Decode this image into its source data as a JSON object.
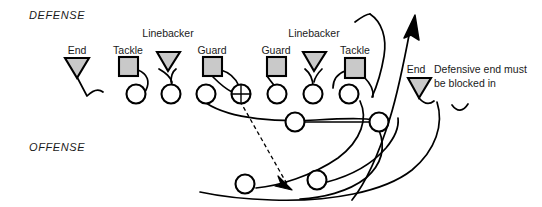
{
  "diagram": {
    "title_defense": "DEFENSE",
    "title_offense": "OFFENSE",
    "note_line1": "Defensive end must",
    "note_line2": "be blocked in",
    "colors": {
      "ink": "#000000",
      "defender_fill": "#c9c9c9",
      "offense_fill": "#ffffff",
      "background": "#ffffff"
    },
    "defenders": [
      {
        "id": "d-end-left",
        "label": "End",
        "shape": "triangle",
        "x": 77,
        "y": 66
      },
      {
        "id": "d-tackle-left",
        "label": "Tackle",
        "shape": "square",
        "x": 128,
        "y": 66
      },
      {
        "id": "d-linebacker-left",
        "label": "Linebacker",
        "shape": "triangle",
        "x": 168,
        "y": 61
      },
      {
        "id": "d-guard-left",
        "label": "Guard",
        "shape": "square",
        "x": 212,
        "y": 66
      },
      {
        "id": "d-guard-right",
        "label": "Guard",
        "shape": "square",
        "x": 276,
        "y": 66
      },
      {
        "id": "d-linebacker-right",
        "label": "Linebacker",
        "shape": "triangle",
        "x": 314,
        "y": 61
      },
      {
        "id": "d-tackle-right",
        "label": "Tackle",
        "shape": "square",
        "x": 355,
        "y": 67
      },
      {
        "id": "d-end-right",
        "label": "End",
        "shape": "triangle",
        "x": 419,
        "y": 87
      }
    ],
    "offense_line": [
      {
        "id": "o-lineman-1",
        "type": "circle",
        "x": 136,
        "y": 94
      },
      {
        "id": "o-lineman-2",
        "type": "circle",
        "x": 171,
        "y": 94
      },
      {
        "id": "o-lineman-3",
        "type": "circle",
        "x": 206,
        "y": 94
      },
      {
        "id": "o-center",
        "type": "center",
        "x": 241,
        "y": 94
      },
      {
        "id": "o-lineman-4",
        "type": "circle",
        "x": 277,
        "y": 94
      },
      {
        "id": "o-lineman-5",
        "type": "circle",
        "x": 313,
        "y": 94
      },
      {
        "id": "o-lineman-6",
        "type": "circle",
        "x": 349,
        "y": 94
      }
    ],
    "offense_backfield": [
      {
        "id": "o-back-1",
        "type": "circle",
        "x": 295,
        "y": 122
      },
      {
        "id": "o-back-2",
        "type": "circle",
        "x": 379,
        "y": 122
      },
      {
        "id": "o-deep-back",
        "type": "circle",
        "x": 245,
        "y": 184
      },
      {
        "id": "o-ball-carrier",
        "type": "circle",
        "x": 317,
        "y": 180
      }
    ],
    "run_arrow": {
      "id": "ball-carrier-path",
      "tip_x": 415,
      "tip_y": 15
    },
    "handoff_arrow": {
      "id": "handoff-path",
      "tip_x": 292,
      "tip_y": 188
    }
  }
}
